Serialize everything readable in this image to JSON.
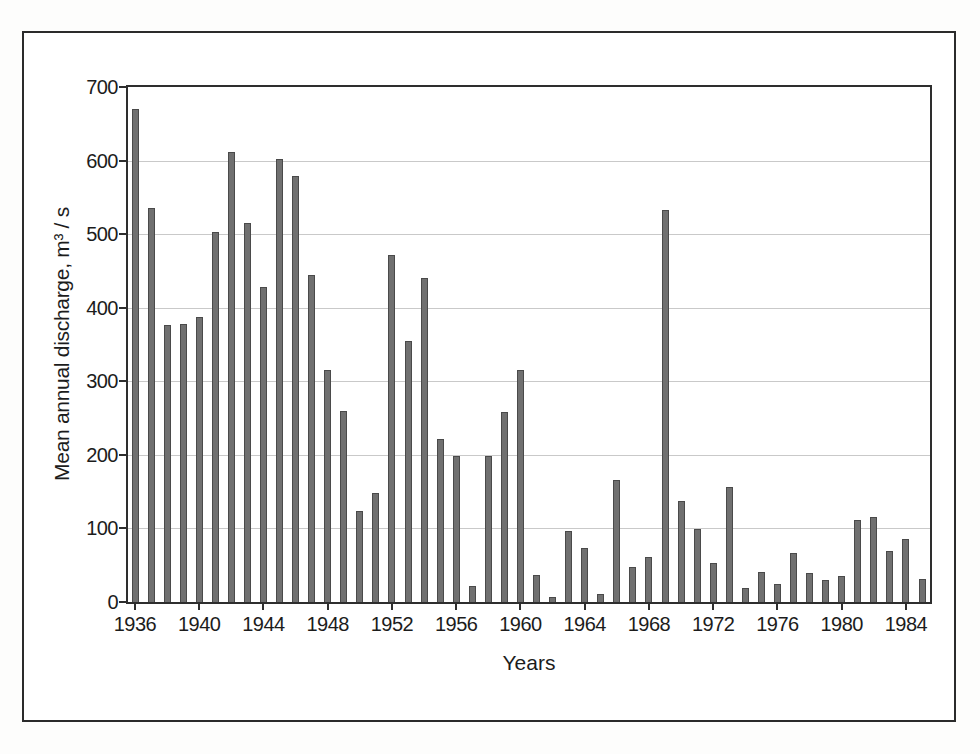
{
  "figure": {
    "background_color": "#ffffff",
    "frame_color": "#2b2b2b"
  },
  "chart_data": {
    "type": "bar",
    "title": "",
    "xlabel": "Years",
    "ylabel": "Mean annual discharge, m³ / s",
    "ylim": [
      0,
      700
    ],
    "yticks": [
      0,
      100,
      200,
      300,
      400,
      500,
      600,
      700
    ],
    "xtick_labels": [
      "1936",
      "1940",
      "1944",
      "1948",
      "1952",
      "1956",
      "1960",
      "1964",
      "1968",
      "1972",
      "1976",
      "1980",
      "1984"
    ],
    "xtick_interval_years": 4,
    "grid": "horizontal",
    "legend_position": "none",
    "bar_color": "#707070",
    "bar_edge_color": "#4a4a4a",
    "gridline_color": "#c9c9c9",
    "categories": [
      1936,
      1937,
      1938,
      1939,
      1940,
      1941,
      1942,
      1943,
      1944,
      1945,
      1946,
      1947,
      1948,
      1949,
      1950,
      1951,
      1952,
      1953,
      1954,
      1955,
      1956,
      1957,
      1958,
      1959,
      1960,
      1961,
      1962,
      1963,
      1964,
      1965,
      1966,
      1967,
      1968,
      1969,
      1970,
      1971,
      1972,
      1973,
      1974,
      1975,
      1976,
      1977,
      1978,
      1979,
      1980,
      1981,
      1982,
      1983,
      1984,
      1985
    ],
    "values": [
      670,
      536,
      376,
      378,
      387,
      503,
      611,
      515,
      428,
      602,
      579,
      444,
      315,
      259,
      124,
      148,
      472,
      355,
      441,
      222,
      198,
      22,
      198,
      258,
      316,
      37,
      7,
      96,
      73,
      11,
      166,
      47,
      61,
      533,
      137,
      99,
      53,
      156,
      19,
      41,
      24,
      66,
      40,
      30,
      36,
      112,
      116,
      70,
      85,
      31
    ]
  }
}
